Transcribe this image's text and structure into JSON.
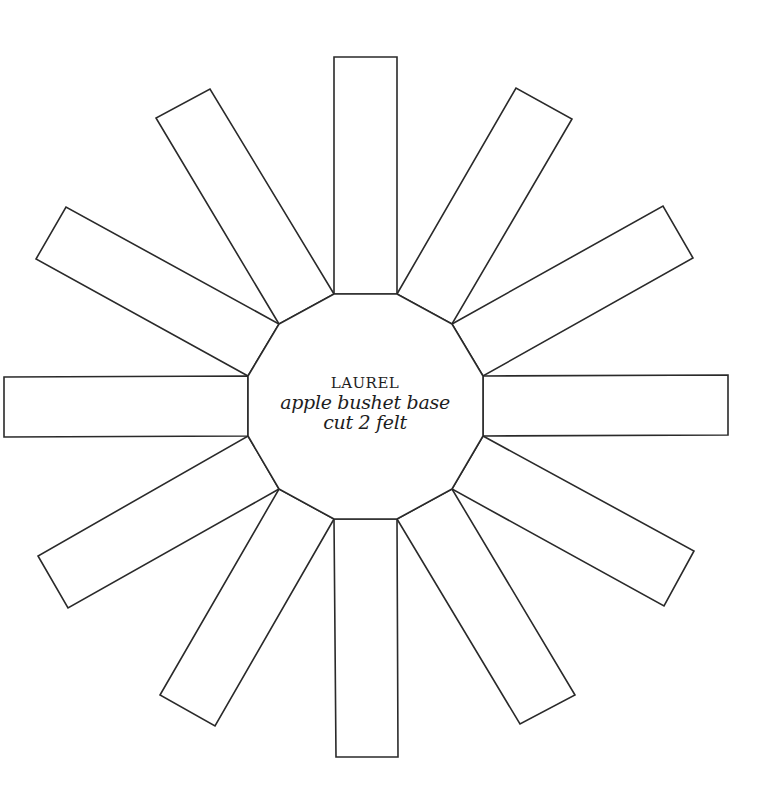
{
  "template": {
    "brand": "LAUREL",
    "name": "apple bushet base",
    "instruction": "cut 2 felt"
  },
  "colors": {
    "background": "#ffffff",
    "stroke": "#2a2a2a",
    "text": "#1e1e1e"
  },
  "geometry": {
    "center": [
      365,
      406
    ],
    "dodecagon": [
      [
        334,
        294
      ],
      [
        397,
        294
      ],
      [
        452,
        324
      ],
      [
        483,
        376
      ],
      [
        483,
        436
      ],
      [
        452,
        489
      ],
      [
        397,
        519
      ],
      [
        334,
        519
      ],
      [
        279,
        489
      ],
      [
        248,
        436
      ],
      [
        248,
        376
      ],
      [
        279,
        324
      ]
    ],
    "strips": [
      {
        "name": "strip-top",
        "points": [
          [
            334,
            294
          ],
          [
            334,
            57
          ],
          [
            397,
            57
          ],
          [
            397,
            294
          ]
        ]
      },
      {
        "name": "strip-top-right",
        "points": [
          [
            397,
            294
          ],
          [
            516,
            88
          ],
          [
            572,
            119
          ],
          [
            452,
            324
          ]
        ]
      },
      {
        "name": "strip-upper-right",
        "points": [
          [
            452,
            324
          ],
          [
            663,
            206
          ],
          [
            693,
            258
          ],
          [
            483,
            376
          ]
        ]
      },
      {
        "name": "strip-right",
        "points": [
          [
            483,
            376
          ],
          [
            728,
            375
          ],
          [
            728,
            435
          ],
          [
            483,
            436
          ]
        ]
      },
      {
        "name": "strip-lower-right",
        "points": [
          [
            483,
            436
          ],
          [
            694,
            551
          ],
          [
            664,
            606
          ],
          [
            452,
            489
          ]
        ]
      },
      {
        "name": "strip-bottom-right",
        "points": [
          [
            452,
            489
          ],
          [
            575,
            695
          ],
          [
            520,
            724
          ],
          [
            397,
            519
          ]
        ]
      },
      {
        "name": "strip-bottom",
        "points": [
          [
            397,
            519
          ],
          [
            398,
            757
          ],
          [
            336,
            757
          ],
          [
            334,
            519
          ]
        ]
      },
      {
        "name": "strip-bottom-left",
        "points": [
          [
            334,
            519
          ],
          [
            215,
            726
          ],
          [
            160,
            695
          ],
          [
            279,
            489
          ]
        ]
      },
      {
        "name": "strip-lower-left",
        "points": [
          [
            279,
            489
          ],
          [
            68,
            608
          ],
          [
            38,
            556
          ],
          [
            248,
            436
          ]
        ]
      },
      {
        "name": "strip-left",
        "points": [
          [
            248,
            436
          ],
          [
            4,
            437
          ],
          [
            4,
            377
          ],
          [
            248,
            376
          ]
        ]
      },
      {
        "name": "strip-upper-left",
        "points": [
          [
            248,
            376
          ],
          [
            36,
            259
          ],
          [
            66,
            207
          ],
          [
            279,
            324
          ]
        ]
      },
      {
        "name": "strip-top-left",
        "points": [
          [
            279,
            324
          ],
          [
            156,
            118
          ],
          [
            210,
            89
          ],
          [
            334,
            294
          ]
        ]
      }
    ]
  }
}
